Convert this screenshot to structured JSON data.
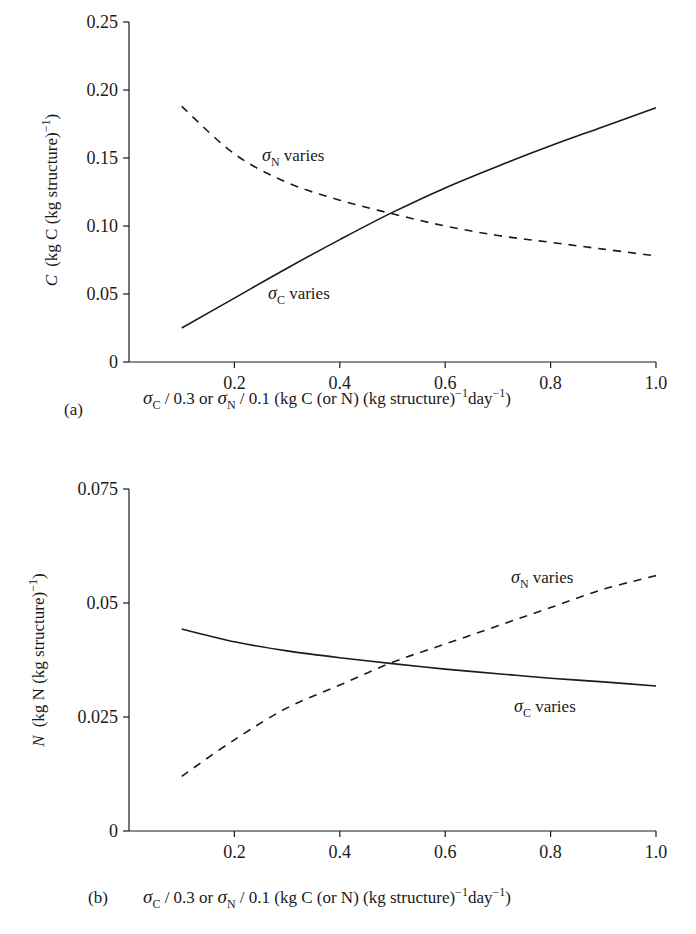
{
  "panels": [
    {
      "label": "(a)",
      "ylabel_var": "C",
      "ylabel_unit": "(kg C (kg structure)",
      "ylabel_exp": "−1",
      "ylabel_close": ")",
      "yticks": [
        "0",
        "0.05",
        "0.10",
        "0.15",
        "0.20",
        "0.25"
      ],
      "xticks": [
        "0.2",
        "0.4",
        "0.6",
        "0.8",
        "1.0"
      ],
      "xlabel": {
        "sigma": "σ",
        "subC": "C",
        "mid1": " / 0.3 or ",
        "subN": "N",
        "mid2": " / 0.1 (kg C (or N) (kg structure)",
        "exp1": "−1",
        "day": "day",
        "exp2": "−1",
        "close": ")"
      },
      "annotations": {
        "sigmaN": {
          "sym": "σ",
          "sub": "N",
          "text": " varies"
        },
        "sigmaC": {
          "sym": "σ",
          "sub": "C",
          "text": " varies"
        }
      }
    },
    {
      "label": "(b)",
      "ylabel_var": "N",
      "ylabel_unit": "(kg N (kg structure)",
      "ylabel_exp": "−1",
      "ylabel_close": ")",
      "yticks": [
        "0",
        "0.025",
        "0.05",
        "0.075"
      ],
      "xticks": [
        "0.2",
        "0.4",
        "0.6",
        "0.8",
        "1.0"
      ],
      "xlabel": {
        "sigma": "σ",
        "subC": "C",
        "mid1": " / 0.3 or ",
        "subN": "N",
        "mid2": " / 0.1 (kg C (or N) (kg structure)",
        "exp1": "−1",
        "day": "day",
        "exp2": "−1",
        "close": ")"
      },
      "annotations": {
        "sigmaN": {
          "sym": "σ",
          "sub": "N",
          "text": " varies"
        },
        "sigmaC": {
          "sym": "σ",
          "sub": "C",
          "text": " varies"
        }
      }
    }
  ],
  "chart_data": [
    {
      "type": "line",
      "title": "(a)",
      "xlabel": "σC / 0.3 or σN / 0.1 (kg C (or N) (kg structure)^-1 day^-1)",
      "ylabel": "C (kg C (kg structure)^-1)",
      "xlim": [
        0,
        1.0
      ],
      "ylim": [
        0,
        0.25
      ],
      "grid": false,
      "legend": "inline annotations",
      "x": [
        0.1,
        0.2,
        0.3,
        0.4,
        0.5,
        0.6,
        0.7,
        0.8,
        0.9,
        1.0
      ],
      "series": [
        {
          "name": "σC varies",
          "style": "solid",
          "values": [
            0.025,
            0.047,
            0.069,
            0.09,
            0.11,
            0.128,
            0.144,
            0.159,
            0.173,
            0.187
          ]
        },
        {
          "name": "σN varies",
          "style": "dashed",
          "values": [
            0.188,
            0.153,
            0.132,
            0.119,
            0.109,
            0.1,
            0.093,
            0.088,
            0.083,
            0.078
          ]
        }
      ]
    },
    {
      "type": "line",
      "title": "(b)",
      "xlabel": "σC / 0.3 or σN / 0.1 (kg C (or N) (kg structure)^-1 day^-1)",
      "ylabel": "N (kg N (kg structure)^-1)",
      "xlim": [
        0,
        1.0
      ],
      "ylim": [
        0,
        0.075
      ],
      "grid": false,
      "legend": "inline annotations",
      "x": [
        0.1,
        0.2,
        0.3,
        0.4,
        0.5,
        0.6,
        0.7,
        0.8,
        0.9,
        1.0
      ],
      "series": [
        {
          "name": "σC varies",
          "style": "solid",
          "values": [
            0.0443,
            0.0415,
            0.0395,
            0.038,
            0.0367,
            0.0355,
            0.0345,
            0.0335,
            0.0327,
            0.0318
          ]
        },
        {
          "name": "σN varies",
          "style": "dashed",
          "values": [
            0.012,
            0.02,
            0.027,
            0.032,
            0.037,
            0.041,
            0.045,
            0.049,
            0.053,
            0.056
          ]
        }
      ]
    }
  ]
}
